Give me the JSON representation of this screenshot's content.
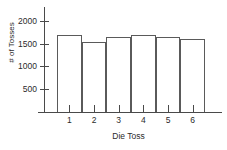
{
  "chart_data": {
    "type": "bar",
    "title": "",
    "subtitle": "",
    "xlabel": "Die Toss",
    "ylabel": "# of Tosses",
    "categories": [
      "1",
      "2",
      "3",
      "4",
      "5",
      "6"
    ],
    "values": [
      1680,
      1530,
      1650,
      1680,
      1650,
      1610
    ],
    "series": [
      {
        "name": "# of Tosses",
        "values": [
          1680,
          1530,
          1650,
          1680,
          1650,
          1610
        ]
      }
    ],
    "ylim": [
      0,
      2300
    ],
    "xlim": [
      0,
      7
    ],
    "ytick_labels": [
      "2000",
      "1500",
      "1000",
      "500"
    ],
    "ytick_values": [
      2000,
      1500,
      1000,
      500
    ],
    "xtick_labels": [
      "1",
      "2",
      "3",
      "4",
      "5",
      "6"
    ],
    "grid": false,
    "legend": false,
    "legend_position": "none",
    "bar_fill_color": "#ffffff",
    "bar_edge_color": "#5a5a5a",
    "axis_color": "#4a4a4a",
    "text_color": "#2b2b2b",
    "background_color": "#ffffff",
    "annotations": []
  }
}
